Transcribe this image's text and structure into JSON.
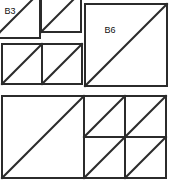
{
  "figure": {
    "canvas": {
      "width": 173,
      "height": 190
    },
    "background_color": "#ffffff",
    "line_color": "#2b2b2b",
    "fill_color": "#ffffff",
    "label_color": "#111111",
    "stroke_width": 2,
    "diagonal_direction": "bottom-left-to-top-right",
    "groups": [
      {
        "name": "top-left-group",
        "description": "two-by-two arrangement of four small squares, each divided by one diagonal",
        "tile_count": 4
      },
      {
        "name": "top-right-group",
        "description": "single large square divided by one diagonal",
        "tile_count": 1
      },
      {
        "name": "bottom-left-group",
        "description": "single large square divided by one diagonal",
        "tile_count": 1
      },
      {
        "name": "bottom-right-group",
        "description": "two-by-two arrangement of four small squares, each divided by one diagonal",
        "tile_count": 4
      }
    ],
    "tiles": [
      {
        "id": "tl-1",
        "group": "top-left-group",
        "x": -6,
        "y": -8,
        "size": 46,
        "label": "B3",
        "label_x": 10,
        "label_y": 12,
        "clipped": true
      },
      {
        "id": "tl-2",
        "group": "top-left-group",
        "x": 41,
        "y": -8,
        "size": 40,
        "label": "",
        "label_x": 0,
        "label_y": 0,
        "clipped": true
      },
      {
        "id": "tl-3",
        "group": "top-left-group",
        "x": 2,
        "y": 44,
        "size": 40,
        "label": "",
        "label_x": 0,
        "label_y": 0,
        "clipped": false
      },
      {
        "id": "tl-4",
        "group": "top-left-group",
        "x": 42,
        "y": 44,
        "size": 40,
        "label": "",
        "label_x": 0,
        "label_y": 0,
        "clipped": false
      },
      {
        "id": "tr-1",
        "group": "top-right-group",
        "x": 85,
        "y": 4,
        "size": 82,
        "label": "B6",
        "label_x": 110,
        "label_y": 31,
        "clipped": false
      },
      {
        "id": "bl-1",
        "group": "bottom-left-group",
        "x": 2,
        "y": 96,
        "size": 82,
        "label": "",
        "label_x": 0,
        "label_y": 0,
        "clipped": false
      },
      {
        "id": "br-1",
        "group": "bottom-right-group",
        "x": 84,
        "y": 96,
        "size": 41,
        "label": "",
        "label_x": 0,
        "label_y": 0,
        "clipped": false
      },
      {
        "id": "br-2",
        "group": "bottom-right-group",
        "x": 125,
        "y": 96,
        "size": 41,
        "label": "",
        "label_x": 0,
        "label_y": 0,
        "clipped": false
      },
      {
        "id": "br-3",
        "group": "bottom-right-group",
        "x": 84,
        "y": 137,
        "size": 41,
        "label": "",
        "label_x": 0,
        "label_y": 0,
        "clipped": false
      },
      {
        "id": "br-4",
        "group": "bottom-right-group",
        "x": 125,
        "y": 137,
        "size": 41,
        "label": "",
        "label_x": 0,
        "label_y": 0,
        "clipped": false
      }
    ],
    "labels": [
      {
        "id": "label-b3",
        "text": "B3"
      },
      {
        "id": "label-b6",
        "text": "B6"
      }
    ]
  }
}
